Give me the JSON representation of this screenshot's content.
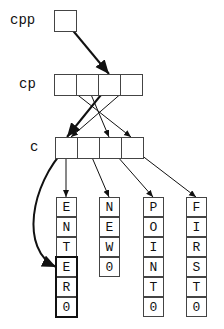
{
  "labels": {
    "cpp": "cpp",
    "cp": "cp",
    "c": "c"
  },
  "strings": [
    {
      "name": "ENTER",
      "chars": [
        "E",
        "N",
        "T",
        "E",
        "R",
        "\u0000"
      ]
    },
    {
      "name": "NEW",
      "chars": [
        "N",
        "E",
        "W",
        "\u0000"
      ]
    },
    {
      "name": "POINT",
      "chars": [
        "P",
        "O",
        "I",
        "N",
        "T",
        "\u0000"
      ]
    },
    {
      "name": "FIRST",
      "chars": [
        "F",
        "I",
        "R",
        "S",
        "T",
        "\u0000"
      ]
    }
  ],
  "display": {
    "ENTER": [
      "E",
      "N",
      "T",
      "E",
      "R",
      "0"
    ],
    "NEW": [
      "N",
      "E",
      "W",
      "0"
    ],
    "POINT": [
      "P",
      "O",
      "I",
      "N",
      "T",
      "0"
    ],
    "FIRST": [
      "F",
      "I",
      "R",
      "S",
      "T",
      "0"
    ]
  }
}
